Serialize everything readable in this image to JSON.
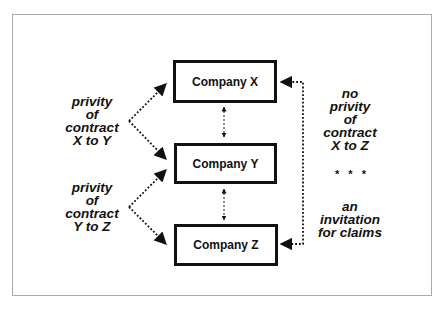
{
  "diagram": {
    "nodes": [
      {
        "id": "x",
        "label": "Company X"
      },
      {
        "id": "y",
        "label": "Company Y"
      },
      {
        "id": "z",
        "label": "Company Z"
      }
    ],
    "left_labels": [
      {
        "lines": [
          "privity",
          "of",
          "contract",
          "X to Y"
        ]
      },
      {
        "lines": [
          "privity",
          "of",
          "contract",
          "Y to Z"
        ]
      }
    ],
    "right_label": {
      "top_lines": [
        "no",
        "privity",
        "of",
        "contract",
        "X to Z"
      ],
      "separator": "* * *",
      "bottom_lines": [
        "an",
        "invitation",
        "for claims"
      ]
    },
    "edges": [
      {
        "from": "left_label_1",
        "to": "x",
        "style": "dotted"
      },
      {
        "from": "left_label_1",
        "to": "y",
        "style": "dotted"
      },
      {
        "from": "left_label_2",
        "to": "y",
        "style": "dotted"
      },
      {
        "from": "left_label_2",
        "to": "z",
        "style": "dotted"
      },
      {
        "from": "x",
        "to": "y",
        "style": "dashed-bidirectional"
      },
      {
        "from": "y",
        "to": "z",
        "style": "dashed-bidirectional"
      },
      {
        "from": "x",
        "to": "z",
        "style": "dotted-bidirectional",
        "via": "right"
      }
    ],
    "colors": {
      "line": "#111111",
      "frame": "#aaaaaa",
      "background": "#ffffff"
    }
  }
}
